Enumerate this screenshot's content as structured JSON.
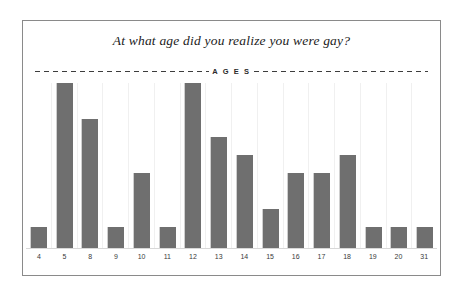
{
  "chart_data": {
    "type": "bar",
    "title": "At what age did you realize you were gay?",
    "xlabel": "AGES",
    "axis_band_label": "A G E S",
    "ylabel": "",
    "categories": [
      "4",
      "5",
      "8",
      "9",
      "10",
      "11",
      "12",
      "13",
      "14",
      "15",
      "16",
      "17",
      "18",
      "19",
      "20",
      "31"
    ],
    "values": [
      1,
      9,
      7,
      1,
      4,
      1,
      9,
      6,
      5,
      2,
      4,
      4,
      5,
      1,
      1,
      1
    ],
    "ylim": [
      0,
      9
    ],
    "grid": true,
    "legend": false,
    "bar_color": "#6f6f6f",
    "frame_color": "#8a8a8a",
    "background_color": "#ffffff"
  }
}
